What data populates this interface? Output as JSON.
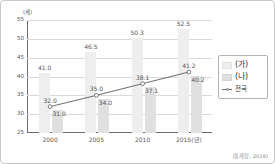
{
  "source_note": "(통계청, 2016)",
  "axis": {
    "y_unit": "(세)",
    "x_unit_suffix": "(년)"
  },
  "legend": {
    "items": [
      {
        "label": "(가)",
        "marker": "swatch-light-gray",
        "color": "#eeeeee"
      },
      {
        "label": "(나)",
        "marker": "swatch-gray",
        "color": "#e0e0e0"
      },
      {
        "label": "전국",
        "marker": "open-circle-line",
        "color": "#6b6b6b"
      }
    ]
  },
  "chart_data": {
    "type": "bar",
    "title": "",
    "subtitle": "",
    "xlabel": "",
    "ylabel": "(세)",
    "categories": [
      "2000",
      "2005",
      "2010",
      "2015(년)"
    ],
    "ylim": [
      25,
      55
    ],
    "yticks": [
      25,
      30,
      35,
      40,
      45,
      50,
      55
    ],
    "ytick_labels": [
      "25",
      "30",
      "35",
      "40",
      "45",
      "50",
      "55"
    ],
    "grid": true,
    "legend_position": "right-outside",
    "series": [
      {
        "name": "(가)",
        "type": "bar",
        "color": "#eeeeee",
        "values": [
          41.0,
          46.5,
          50.3,
          52.5
        ],
        "labels": [
          "41.0",
          "46.5",
          "50.3",
          "52.5"
        ]
      },
      {
        "name": "(나)",
        "type": "bar",
        "color": "#e0e0e0",
        "values": [
          31.0,
          34.0,
          37.1,
          40.2
        ],
        "labels": [
          "31.0",
          "34.0",
          "37.1",
          "40.2"
        ]
      },
      {
        "name": "전국",
        "type": "line",
        "color": "#6b6b6b",
        "values": [
          32.0,
          35.0,
          38.1,
          41.2
        ],
        "labels": [
          "32.0",
          "35.0",
          "38.1",
          "41.2"
        ]
      }
    ]
  }
}
